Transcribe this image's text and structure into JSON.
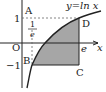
{
  "diagram": {
    "curve_label": "y=ln x",
    "axis_x_label": "x",
    "origin_label": "O",
    "points": {
      "A": "A",
      "B": "B",
      "C": "C",
      "D": "D"
    },
    "ticks": {
      "y_one": "1",
      "y_neg_one": "−1",
      "x_e": "e",
      "x_inv_e_num": "1",
      "x_inv_e_den": "e"
    },
    "colors": {
      "shade": "#a6a6a6",
      "stroke": "#222222",
      "dashed": "#666666"
    }
  }
}
